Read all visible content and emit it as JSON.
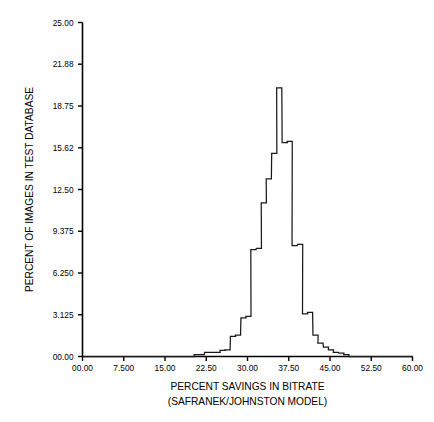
{
  "chart_data": {
    "type": "line",
    "title": "",
    "xlabel": "PERCENT SAVINGS IN BITRATE",
    "xlabel_line2": "(SAFRANEK/JOHNSTON MODEL)",
    "ylabel": "PERCENT OF IMAGES IN TEST DATABASE",
    "xlim": [
      0.0,
      60.0
    ],
    "ylim": [
      0.0,
      25.0
    ],
    "grid": false,
    "legend": null,
    "style": "step-histogram-outline",
    "xticks": [
      "00.00",
      "7.500",
      "15.00",
      "22.50",
      "30.00",
      "37.50",
      "45.00",
      "52.50",
      "60.00"
    ],
    "xtick_values": [
      0.0,
      7.5,
      15.0,
      22.5,
      30.0,
      37.5,
      45.0,
      52.5,
      60.0
    ],
    "yticks": [
      "00.00",
      "3.125",
      "6.250",
      "9.375",
      "12.50",
      "15.62",
      "18.75",
      "21.88",
      "25.00"
    ],
    "ytick_values": [
      0.0,
      3.125,
      6.25,
      9.375,
      12.5,
      15.62,
      18.75,
      21.88,
      25.0
    ],
    "bin_width": 0.9375,
    "bin_left_edges": [
      20.3,
      21.2,
      22.2,
      23.1,
      24.1,
      25.0,
      25.9,
      26.9,
      27.8,
      28.8,
      29.7,
      30.6,
      31.6,
      32.5,
      33.4,
      34.4,
      35.3,
      36.3,
      37.2,
      38.1,
      39.1,
      40.0,
      40.9,
      41.9,
      42.8,
      43.8,
      44.7,
      45.6,
      46.6,
      47.5
    ],
    "values": [
      0.15,
      0.15,
      0.3,
      0.3,
      0.3,
      0.45,
      0.5,
      1.5,
      1.6,
      2.9,
      3.0,
      8.0,
      8.1,
      11.5,
      13.3,
      15.2,
      20.1,
      16.0,
      16.1,
      8.3,
      8.4,
      3.2,
      3.3,
      1.6,
      1.0,
      0.7,
      0.5,
      0.3,
      0.25,
      0.15
    ],
    "line_color": "#1a1a1a",
    "axis_color": "#000000",
    "background": "#ffffff",
    "peak": {
      "x": 33.9,
      "y": 20.1
    }
  }
}
